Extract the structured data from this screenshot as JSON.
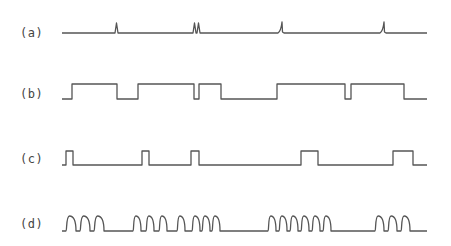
{
  "diagram": {
    "type": "waveform-timing-diagram",
    "line_color": "#555555",
    "rows": [
      {
        "id": "a",
        "label": "(a)",
        "kind": "spikes",
        "baseline_y": 33,
        "x_start": 62,
        "x_end": 427,
        "events": [
          {
            "x": 117,
            "shape": "spike"
          },
          {
            "x": 195,
            "shape": "spike"
          },
          {
            "x": 199,
            "shape": "spike"
          },
          {
            "x": 280,
            "shape": "ramp-spike"
          },
          {
            "x": 382,
            "shape": "ramp-spike"
          }
        ]
      },
      {
        "id": "b",
        "label": "(b)",
        "kind": "square",
        "low_y": 99,
        "high_y": 84,
        "x_start": 62,
        "x_end": 427,
        "pulses": [
          [
            72,
            117
          ],
          [
            138,
            194
          ],
          [
            199,
            221
          ],
          [
            277,
            345
          ],
          [
            351,
            404
          ]
        ]
      },
      {
        "id": "c",
        "label": "(c)",
        "kind": "square",
        "low_y": 165,
        "high_y": 151,
        "x_start": 62,
        "x_end": 427,
        "pulses": [
          [
            66,
            73
          ],
          [
            142,
            149
          ],
          [
            191,
            199
          ],
          [
            301,
            318
          ],
          [
            393,
            413
          ]
        ]
      },
      {
        "id": "d",
        "label": "(d)",
        "kind": "rounded-bursts",
        "low_y": 231,
        "high_y": 216,
        "x_start": 62,
        "x_end": 427,
        "bursts": [
          {
            "x_start": 66,
            "count": 3,
            "width": 10,
            "gap": 4
          },
          {
            "x_start": 133,
            "count": 3,
            "width": 8,
            "gap": 5
          },
          {
            "x_start": 177,
            "count": 1,
            "width": 8,
            "gap": 0
          },
          {
            "x_start": 192,
            "count": 3,
            "width": 8,
            "gap": 2
          },
          {
            "x_start": 268,
            "count": 6,
            "width": 8,
            "gap": 3
          },
          {
            "x_start": 375,
            "count": 3,
            "width": 9,
            "gap": 4
          }
        ]
      }
    ]
  }
}
